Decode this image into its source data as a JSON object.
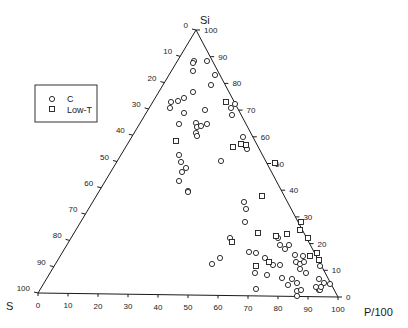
{
  "diagram": {
    "type": "ternary",
    "vertices": {
      "top": {
        "label": "Si",
        "x": 196,
        "y": 30
      },
      "left": {
        "label": "S",
        "x": 38,
        "y": 293
      },
      "right": {
        "label": "P/100",
        "x": 338,
        "y": 297
      }
    },
    "left_axis_ticks": [
      "0",
      "10",
      "20",
      "30",
      "40",
      "50",
      "60",
      "70",
      "80",
      "90",
      "100"
    ],
    "right_axis_ticks": [
      "100",
      "90",
      "80",
      "70",
      "60",
      "50",
      "40",
      "30",
      "20",
      "10",
      "0"
    ],
    "bottom_axis_ticks": [
      "0",
      "10",
      "20",
      "30",
      "40",
      "50",
      "60",
      "70",
      "80",
      "90",
      "100"
    ],
    "legend": {
      "items": [
        {
          "symbol": "circle",
          "label": "C"
        },
        {
          "symbol": "square",
          "label": "Low-T"
        }
      ]
    },
    "points": {
      "C": [
        [
          194,
          61
        ],
        [
          193,
          63
        ],
        [
          193,
          71
        ],
        [
          207,
          61
        ],
        [
          215,
          75
        ],
        [
          211,
          85
        ],
        [
          193,
          92
        ],
        [
          178,
          101
        ],
        [
          184,
          98
        ],
        [
          171,
          102
        ],
        [
          170,
          108
        ],
        [
          184,
          113
        ],
        [
          205,
          110
        ],
        [
          231,
          108
        ],
        [
          235,
          104
        ],
        [
          232,
          115
        ],
        [
          179,
          124
        ],
        [
          196,
          123
        ],
        [
          197,
          127
        ],
        [
          201,
          126
        ],
        [
          207,
          124
        ],
        [
          196,
          133
        ],
        [
          197,
          136
        ],
        [
          243,
          137
        ],
        [
          247,
          149
        ],
        [
          221,
          161
        ],
        [
          179,
          155
        ],
        [
          181,
          162
        ],
        [
          186,
          168
        ],
        [
          182,
          172
        ],
        [
          179,
          181
        ],
        [
          188,
          191
        ],
        [
          188,
          192
        ],
        [
          244,
          202
        ],
        [
          246,
          209
        ],
        [
          245,
          222
        ],
        [
          256,
          253
        ],
        [
          249,
          252
        ],
        [
          220,
          258
        ],
        [
          212,
          264
        ],
        [
          265,
          258
        ],
        [
          230,
          238
        ],
        [
          278,
          238
        ],
        [
          280,
          245
        ],
        [
          289,
          245
        ],
        [
          285,
          249
        ],
        [
          295,
          255
        ],
        [
          296,
          262
        ],
        [
          303,
          256
        ],
        [
          300,
          269
        ],
        [
          292,
          279
        ],
        [
          297,
          296
        ],
        [
          255,
          273
        ],
        [
          267,
          275
        ],
        [
          256,
          289
        ],
        [
          282,
          278
        ],
        [
          288,
          285
        ],
        [
          306,
          273
        ],
        [
          297,
          291
        ],
        [
          301,
          290
        ],
        [
          319,
          290
        ],
        [
          320,
          290
        ],
        [
          319,
          279
        ],
        [
          324,
          283
        ],
        [
          330,
          284
        ],
        [
          320,
          266
        ],
        [
          280,
          265
        ],
        [
          273,
          265
        ],
        [
          300,
          264
        ],
        [
          304,
          262
        ],
        [
          297,
          283
        ],
        [
          316,
          287
        ],
        [
          321,
          287
        ]
      ],
      "Low-T": [
        [
          176,
          141
        ],
        [
          241,
          144
        ],
        [
          226,
          102
        ],
        [
          233,
          147
        ],
        [
          246,
          145
        ],
        [
          275,
          163
        ],
        [
          262,
          196
        ],
        [
          258,
          233
        ],
        [
          232,
          242
        ],
        [
          276,
          236
        ],
        [
          287,
          234
        ],
        [
          256,
          266
        ],
        [
          269,
          262
        ],
        [
          301,
          222
        ],
        [
          300,
          230
        ],
        [
          308,
          238
        ],
        [
          310,
          256
        ],
        [
          317,
          253
        ],
        [
          319,
          260
        ]
      ]
    }
  }
}
